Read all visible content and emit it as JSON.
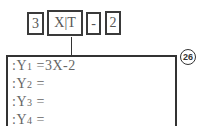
{
  "keys": [
    {
      "label": "3"
    },
    {
      "label": "X|T"
    },
    {
      "label": "-"
    },
    {
      "label": "2"
    }
  ],
  "screen": {
    "lines": [
      {
        "prefix": ":Y",
        "sub": "1",
        "rest": " =3X-2"
      },
      {
        "prefix": ":Y",
        "sub": "2",
        "rest": " ="
      },
      {
        "prefix": ":Y",
        "sub": "3",
        "rest": " ="
      },
      {
        "prefix": ":Y",
        "sub": "4",
        "rest": " ="
      }
    ]
  },
  "step_badge": "26"
}
